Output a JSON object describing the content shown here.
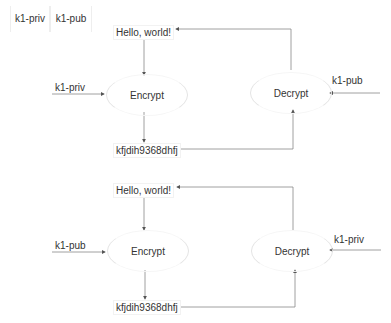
{
  "legend": {
    "keys": [
      {
        "label": "k1-priv"
      },
      {
        "label": "k1-pub"
      }
    ]
  },
  "diagrams": [
    {
      "plaintext": "Hello, world!",
      "process_encrypt": "Encrypt",
      "process_decrypt": "Decrypt",
      "ciphertext": "kfjdih9368dhfj",
      "encrypt_key": "k1-priv",
      "decrypt_key": "k1-pub"
    },
    {
      "plaintext": "Hello, world!",
      "process_encrypt": "Encrypt",
      "process_decrypt": "Decrypt",
      "ciphertext": "kfjdih9368dhfj",
      "encrypt_key": "k1-pub",
      "decrypt_key": "k1-priv"
    }
  ],
  "colors": {
    "line": "#777777",
    "text": "#333333",
    "shape_border": "#e4e4e4"
  }
}
